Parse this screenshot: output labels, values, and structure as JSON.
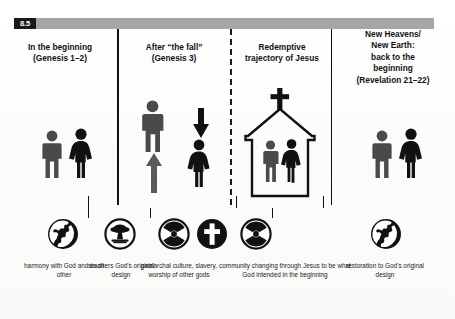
{
  "figure": {
    "number": "8.5",
    "header_bar_color": "#a6a6a6",
    "figure_tag_color": "#1a1a1a"
  },
  "columns": [
    {
      "id": "col-beginning",
      "heading": "In the beginning\n(Genesis 1–2)",
      "heading_line1": "In the beginning",
      "heading_line2": "(Genesis 1–2)",
      "pictogram": "man-and-woman-equal",
      "icon": "globe-icon",
      "caption": "harmony with God and each other"
    },
    {
      "id": "col-fall",
      "heading_line1": "After “the fall”",
      "heading_line2": "(Genesis 3)",
      "pictogram": "man-raised-woman-lowered",
      "icon": "mushroom-cloud-icon",
      "caption": "sin alters God's original design",
      "icon_secondary": "radiation-icon",
      "caption_secondary": "patriarchal culture, slavery, worship of other gods"
    },
    {
      "id": "col-redemptive",
      "heading_line1": "Redemptive",
      "heading_line2": "trajectory of Jesus",
      "pictogram": "church-with-man-and-woman",
      "icon": "cross-icon",
      "icon_secondary": "radiation-icon",
      "caption": "community changing through Jesus to be what God intended in the beginning"
    },
    {
      "id": "col-new-heavens",
      "heading_line1": "New Heavens/",
      "heading_line2": "New Earth:",
      "heading_line3": "back to the",
      "heading_line4": "beginning",
      "heading_line5": "(Revelation 21–22)",
      "pictogram": "man-and-woman-equal",
      "icon": "globe-icon",
      "caption": "restoration to God's original design"
    }
  ],
  "headings": {
    "h1_l1": "In the beginning",
    "h1_l2": "(Genesis 1–2)",
    "h2_l1": "After “the fall”",
    "h2_l2": "(Genesis 3)",
    "h3_l1": "Redemptive",
    "h3_l2": "trajectory of Jesus",
    "h4_l1": "New Heavens/",
    "h4_l2": "New Earth:",
    "h4_l3": "back to the",
    "h4_l4": "beginning",
    "h4_l5": "(Revelation 21–22)"
  },
  "captions": {
    "c1": "harmony with God and each other",
    "c2": "sin alters God's original design",
    "c3": "patriarchal culture, slavery, worship of other gods",
    "c4": "community changing through Jesus to be what God intended in the beginning",
    "c5": "restoration to God's original design"
  },
  "icons": [
    {
      "name": "globe-icon",
      "column": 1
    },
    {
      "name": "mushroom-cloud-icon",
      "column": 2
    },
    {
      "name": "radiation-icon",
      "column": 2
    },
    {
      "name": "cross-icon",
      "column": 3
    },
    {
      "name": "radiation-icon",
      "column": 3
    },
    {
      "name": "globe-icon",
      "column": 4
    }
  ],
  "colors": {
    "ink": "#111111",
    "header_gray": "#a6a6a6",
    "figure_person_dark_gray": "#4a4a4a",
    "figure_person_black": "#111111",
    "paper": "#ffffff"
  },
  "dividers": [
    {
      "name": "divider-solid-1",
      "style": "solid"
    },
    {
      "name": "divider-dashed-2",
      "style": "dashed"
    },
    {
      "name": "divider-solid-3",
      "style": "solid"
    }
  ]
}
